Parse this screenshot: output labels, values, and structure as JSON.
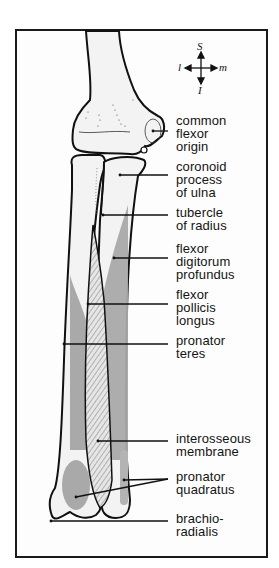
{
  "figure": {
    "colors": {
      "bone_fill": "#f2f2f2",
      "outline": "#111111",
      "attachment_gray": "#a9a9a9",
      "membrane_hatch": "#8a8a8a",
      "frame": "#1a1a1a"
    }
  },
  "compass": {
    "superior": "S",
    "inferior": "I",
    "lateral": "l",
    "medial": "m"
  },
  "labels": [
    {
      "id": "common-flexor-origin",
      "text": "common\nflexor\norigin"
    },
    {
      "id": "coronoid-process",
      "text": "coronoid\nprocess\nof ulna"
    },
    {
      "id": "tubercle-of-radius",
      "text": "tubercle\nof radius"
    },
    {
      "id": "flexor-digitorum-profundus",
      "text": "flexor\ndigitorum\nprofundus"
    },
    {
      "id": "flexor-pollicis-longus",
      "text": "flexor\npollicis\nlongus"
    },
    {
      "id": "pronator-teres",
      "text": "pronator\nteres"
    },
    {
      "id": "interosseous-membrane",
      "text": "interosseous\nmembrane"
    },
    {
      "id": "pronator-quadratus",
      "text": "pronator\nquadratus"
    },
    {
      "id": "brachioradialis",
      "text": "brachio-\nradialis"
    }
  ]
}
